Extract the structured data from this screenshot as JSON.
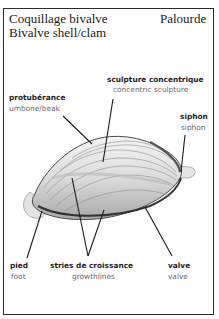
{
  "header": {
    "title_fr": "Coquillage bivalve",
    "title_en": "Bivalve shell/clam",
    "species": "Palourde"
  },
  "labels": {
    "sculpture": {
      "fr": "sculpture  concentrique",
      "en": "concentric  sculpture"
    },
    "umbone": {
      "fr": "protubérance",
      "en": "umbone/beak"
    },
    "siphon": {
      "fr": "siphon",
      "en": "siphon"
    },
    "foot": {
      "fr": "pied",
      "en": "foot"
    },
    "growthlines": {
      "fr": "stries  de  croissance",
      "en": "growthlines"
    },
    "valve": {
      "fr": "valve",
      "en": "valve"
    }
  },
  "colors": {
    "frame": "#2a2a2a",
    "line": "#1a1a1a",
    "shell_light": "#efefef",
    "shell_dark": "#8a8a8a"
  }
}
